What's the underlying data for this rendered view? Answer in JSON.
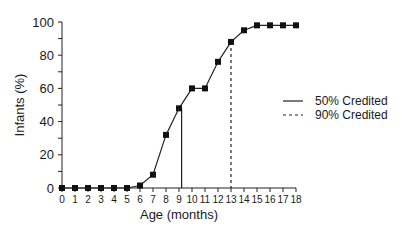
{
  "chart_data": {
    "type": "line",
    "title": "",
    "xlabel": "Age (months)",
    "ylabel": "Infants (%)",
    "x": [
      0,
      1,
      2,
      3,
      4,
      5,
      6,
      7,
      8,
      9,
      10,
      11,
      12,
      13,
      14,
      15,
      16,
      17,
      18
    ],
    "series": [
      {
        "name": "Infants credited (%)",
        "values": [
          0,
          0,
          0,
          0,
          0,
          0,
          1.5,
          8,
          32,
          48,
          60,
          60,
          76,
          88,
          95,
          98,
          98,
          98,
          98
        ],
        "marker": "square"
      }
    ],
    "reference_lines": [
      {
        "name": "50% Credited",
        "x": 9.2,
        "style": "solid"
      },
      {
        "name": "90% Credited",
        "x": 13,
        "style": "dashed"
      }
    ],
    "xlim": [
      0,
      18
    ],
    "ylim": [
      0,
      100
    ],
    "xticks": [
      "0",
      "1",
      "2",
      "3",
      "4",
      "5",
      "6",
      "7",
      "8",
      "9",
      "10",
      "11",
      "12",
      "13",
      "14",
      "15",
      "16",
      "17",
      "18"
    ],
    "yticks": [
      "0",
      "20",
      "40",
      "60",
      "80",
      "100"
    ],
    "grid": false,
    "legend_position": "right"
  },
  "legend": [
    {
      "label": "50% Credited",
      "style": "solid"
    },
    {
      "label": "90% Credited",
      "style": "dashed"
    }
  ]
}
